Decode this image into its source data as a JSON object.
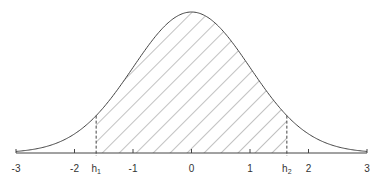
{
  "chart_data": {
    "type": "area",
    "title": "",
    "xlabel": "",
    "ylabel": "",
    "xlim": [
      -3,
      3
    ],
    "ticks": [
      "-3",
      "-2",
      "-1",
      "0",
      "1",
      "2",
      "3"
    ],
    "tick_values": [
      -3,
      -2,
      -1,
      0,
      1,
      2,
      3
    ],
    "markers": [
      {
        "label": "h",
        "sub": "1",
        "value": -1.63
      },
      {
        "label": "h",
        "sub": "2",
        "value": 1.63
      }
    ],
    "shaded_region": {
      "from": -1.63,
      "to": 1.63,
      "style": "diagonal hatch"
    },
    "curve": "normal(0,1)",
    "grid": false,
    "legend": null
  },
  "colors": {
    "line": "#444444",
    "hatch": "#555555",
    "axis": "#444444",
    "text": "#333333"
  }
}
